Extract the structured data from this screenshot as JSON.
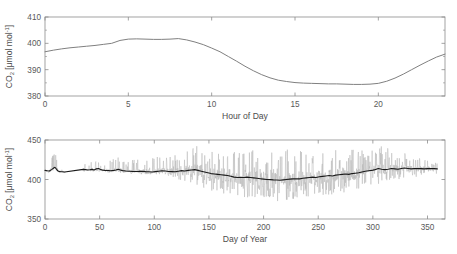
{
  "figure": {
    "background_color": "#ffffff",
    "panel_count": 2
  },
  "chart_data": [
    {
      "type": "line",
      "title": "",
      "subtitle": "",
      "panel": "top",
      "xlabel": "Hour of Day",
      "ylabel": "CO2 [umol mol-1]",
      "ylabel_display": "CO₂ [μmol mol⁻¹]",
      "xlim": [
        0,
        24
      ],
      "ylim": [
        380,
        410
      ],
      "xticks": [
        0,
        5,
        10,
        15,
        20
      ],
      "yticks": [
        380,
        390,
        400,
        410
      ],
      "grid": false,
      "legend": null,
      "series": [
        {
          "name": "Mean diurnal CO2",
          "color": "#808080",
          "linewidth": 1.0,
          "x": [
            0,
            0.5,
            1,
            1.5,
            2,
            2.5,
            3,
            3.5,
            4,
            4.5,
            5,
            5.5,
            6,
            6.5,
            7,
            7.5,
            8,
            8.5,
            9,
            9.5,
            10,
            10.5,
            11,
            11.5,
            12,
            12.5,
            13,
            13.5,
            14,
            14.5,
            15,
            15.5,
            16,
            16.5,
            17,
            17.5,
            18,
            18.5,
            19,
            19.5,
            20,
            20.5,
            21,
            21.5,
            22,
            22.5,
            23,
            23.5,
            24
          ],
          "y": [
            396.8,
            397.4,
            397.9,
            398.3,
            398.6,
            398.9,
            399.2,
            399.6,
            400.0,
            401.1,
            401.6,
            401.7,
            401.6,
            401.5,
            401.5,
            401.6,
            401.8,
            401.3,
            400.5,
            399.5,
            398.2,
            396.8,
            395.0,
            393.2,
            391.3,
            389.6,
            388.1,
            386.9,
            386.0,
            385.5,
            385.1,
            384.9,
            384.8,
            384.7,
            384.6,
            384.6,
            384.5,
            384.4,
            384.4,
            384.5,
            384.8,
            385.6,
            386.8,
            388.3,
            390.0,
            391.7,
            393.3,
            394.8,
            395.9
          ]
        }
      ]
    },
    {
      "type": "line",
      "title": "",
      "subtitle": "",
      "panel": "bottom",
      "xlabel": "Day of Year",
      "ylabel": "CO2 [umol mol-1]",
      "ylabel_display": "CO₂ [μmol mol⁻¹]",
      "xlim": [
        0,
        366
      ],
      "ylim": [
        350,
        450
      ],
      "xticks": [
        0,
        50,
        100,
        150,
        200,
        250,
        300,
        350
      ],
      "yticks": [
        350,
        400,
        450
      ],
      "grid": false,
      "legend": null,
      "data_gap_x": [
        19,
        35
      ],
      "series": [
        {
          "name": "Half-hourly CO2",
          "color": "#b3b3b3",
          "linewidth": 0.5,
          "note": "high-frequency raw signal, envelope roughly +-20 umol mol-1 widening after day 140",
          "x": [
            0,
            2,
            4,
            6,
            8,
            9,
            10,
            11,
            12,
            14,
            16,
            18,
            35,
            37,
            39,
            41,
            43,
            45,
            47,
            49,
            51,
            55,
            60,
            65,
            68,
            70,
            75,
            80,
            85,
            90,
            95,
            100,
            105,
            110,
            115,
            118,
            120,
            125,
            130,
            135,
            138,
            140,
            143,
            146,
            148,
            150,
            155,
            160,
            165,
            170,
            175,
            180,
            185,
            190,
            195,
            200,
            205,
            210,
            215,
            220,
            225,
            230,
            235,
            240,
            245,
            250,
            255,
            260,
            265,
            270,
            275,
            280,
            285,
            290,
            295,
            300,
            305,
            310,
            315,
            320,
            325,
            330,
            335,
            340,
            345,
            350,
            355,
            360,
            365
          ],
          "y_upper": [
            415,
            416,
            418,
            428,
            433,
            436,
            430,
            423,
            418,
            414,
            412,
            411,
            418,
            420,
            419,
            421,
            423,
            420,
            424,
            422,
            420,
            422,
            425,
            430,
            428,
            423,
            424,
            425,
            427,
            426,
            428,
            427,
            430,
            431,
            433,
            430,
            432,
            436,
            438,
            440,
            444,
            441,
            443,
            445,
            443,
            442,
            438,
            436,
            440,
            438,
            436,
            439,
            441,
            438,
            437,
            440,
            438,
            436,
            437,
            439,
            436,
            438,
            440,
            437,
            439,
            441,
            438,
            440,
            437,
            439,
            441,
            438,
            440,
            437,
            436,
            438,
            440,
            445,
            438,
            436,
            434,
            433,
            430,
            428,
            426,
            424,
            422,
            420,
            419
          ],
          "y_lower": [
            409,
            408,
            408,
            412,
            414,
            415,
            412,
            410,
            409,
            408,
            408,
            408,
            410,
            409,
            408,
            409,
            410,
            409,
            410,
            409,
            408,
            409,
            409,
            410,
            409,
            408,
            408,
            407,
            407,
            406,
            406,
            406,
            405,
            405,
            404,
            403,
            402,
            398,
            396,
            394,
            392,
            390,
            388,
            386,
            388,
            387,
            385,
            383,
            381,
            380,
            379,
            378,
            377,
            376,
            375,
            374,
            374,
            373,
            372,
            372,
            373,
            374,
            375,
            376,
            377,
            378,
            379,
            380,
            381,
            382,
            383,
            384,
            386,
            388,
            390,
            392,
            394,
            396,
            398,
            399,
            400,
            401,
            402,
            403,
            404,
            405,
            406,
            407,
            408
          ]
        },
        {
          "name": "Daily mean CO2",
          "color": "#1a1a1a",
          "linewidth": 1.1,
          "x": [
            0,
            2,
            4,
            6,
            8,
            9,
            10,
            11,
            12,
            13,
            14,
            16,
            18,
            35,
            37,
            39,
            41,
            43,
            45,
            47,
            49,
            51,
            53,
            55,
            58,
            60,
            63,
            65,
            67,
            69,
            71,
            74,
            77,
            80,
            83,
            86,
            89,
            92,
            95,
            98,
            101,
            104,
            107,
            110,
            113,
            116,
            119,
            122,
            125,
            128,
            131,
            134,
            137,
            140,
            143,
            146,
            149,
            152,
            155,
            158,
            161,
            164,
            167,
            170,
            173,
            176,
            179,
            182,
            185,
            188,
            191,
            194,
            197,
            200,
            203,
            206,
            209,
            212,
            215,
            218,
            221,
            224,
            227,
            230,
            233,
            236,
            239,
            242,
            245,
            248,
            251,
            254,
            257,
            260,
            263,
            266,
            269,
            272,
            275,
            278,
            281,
            284,
            287,
            290,
            293,
            296,
            299,
            302,
            305,
            308,
            311,
            314,
            317,
            320,
            323,
            326,
            329,
            332,
            335,
            338,
            341,
            344,
            347,
            350,
            353,
            356,
            359,
            362,
            365
          ],
          "y": [
            411.5,
            411.0,
            410.8,
            412.5,
            414.5,
            415.5,
            414.0,
            412.0,
            410.8,
            410.2,
            410.0,
            409.8,
            409.5,
            412.8,
            412.5,
            412.0,
            412.3,
            412.8,
            412.0,
            413.5,
            414.0,
            412.5,
            411.8,
            411.5,
            411.3,
            411.0,
            411.5,
            412.0,
            413.0,
            412.0,
            411.2,
            410.8,
            410.5,
            410.3,
            410.2,
            410.3,
            410.5,
            410.0,
            409.8,
            409.5,
            410.0,
            410.5,
            411.0,
            410.8,
            410.2,
            410.0,
            409.8,
            410.5,
            411.2,
            410.8,
            411.5,
            412.0,
            412.5,
            411.5,
            410.5,
            409.5,
            408.5,
            407.5,
            407.0,
            406.5,
            406.0,
            405.5,
            405.0,
            404.0,
            403.0,
            402.5,
            402.8,
            402.5,
            403.0,
            402.5,
            402.0,
            401.5,
            401.0,
            400.5,
            400.0,
            399.8,
            399.5,
            399.3,
            399.0,
            399.5,
            400.0,
            400.5,
            400.8,
            401.0,
            400.8,
            401.5,
            402.0,
            402.5,
            403.0,
            402.5,
            403.5,
            404.0,
            404.5,
            405.0,
            404.5,
            405.5,
            406.0,
            406.5,
            407.0,
            406.5,
            407.5,
            408.0,
            408.5,
            409.5,
            410.5,
            411.0,
            411.5,
            412.5,
            414.0,
            413.0,
            412.5,
            413.0,
            414.0,
            413.5,
            413.0,
            414.0,
            414.5,
            414.0,
            413.5,
            413.8,
            414.0,
            413.8,
            413.5,
            413.8,
            414.0,
            413.8,
            413.5
          ]
        }
      ]
    }
  ]
}
